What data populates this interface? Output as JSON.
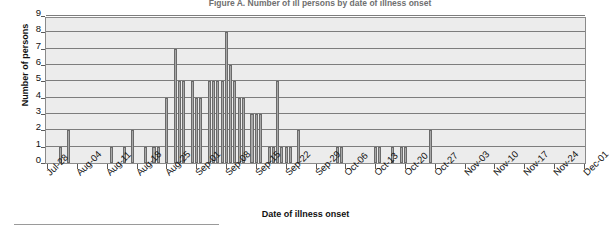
{
  "chart_data": {
    "type": "bar",
    "title": "Figure A. Number of ill persons by date of illness onset",
    "xlabel": "Date of illness onset",
    "ylabel": "Number of persons",
    "ylim": [
      0,
      9
    ],
    "ytick_labels": [
      "0",
      "1",
      "2",
      "3",
      "4",
      "5",
      "6",
      "7",
      "8",
      "9"
    ],
    "grid": true,
    "legend": "none",
    "xtick_labels": [
      "Jul-28",
      "Aug-04",
      "Aug-11",
      "Aug-18",
      "Aug-25",
      "Sep-01",
      "Sep-08",
      "Sep-15",
      "Sep-22",
      "Sep-29",
      "Oct-06",
      "Oct-13",
      "Oct-20",
      "Oct-27",
      "Nov-03",
      "Nov-10",
      "Nov-17",
      "Nov-24",
      "Dec-01"
    ],
    "xtick_interval_days": 7,
    "x_start": "Jul-28",
    "x_end": "Dec-01",
    "bar_color": "#a8a8a8",
    "bar_edge_color": "#6a6a6a",
    "plot_background": "#ececec",
    "categories": [
      "Jul-28",
      "Jul-29",
      "Jul-30",
      "Jul-31",
      "Aug-01",
      "Aug-02",
      "Aug-03",
      "Aug-04",
      "Aug-05",
      "Aug-06",
      "Aug-07",
      "Aug-08",
      "Aug-09",
      "Aug-10",
      "Aug-11",
      "Aug-12",
      "Aug-13",
      "Aug-14",
      "Aug-15",
      "Aug-16",
      "Aug-17",
      "Aug-18",
      "Aug-19",
      "Aug-20",
      "Aug-21",
      "Aug-22",
      "Aug-23",
      "Aug-24",
      "Aug-25",
      "Aug-26",
      "Aug-27",
      "Aug-28",
      "Aug-29",
      "Aug-30",
      "Aug-31",
      "Sep-01",
      "Sep-02",
      "Sep-03",
      "Sep-04",
      "Sep-05",
      "Sep-06",
      "Sep-07",
      "Sep-08",
      "Sep-09",
      "Sep-10",
      "Sep-11",
      "Sep-12",
      "Sep-13",
      "Sep-14",
      "Sep-15",
      "Sep-16",
      "Sep-17",
      "Sep-18",
      "Sep-19",
      "Sep-20",
      "Sep-21",
      "Sep-22",
      "Sep-23",
      "Sep-24",
      "Sep-25",
      "Sep-26",
      "Sep-27",
      "Sep-28",
      "Sep-29",
      "Sep-30",
      "Oct-01",
      "Oct-02",
      "Oct-03",
      "Oct-04",
      "Oct-05",
      "Oct-06",
      "Oct-07",
      "Oct-08",
      "Oct-09",
      "Oct-10",
      "Oct-11",
      "Oct-12",
      "Oct-13",
      "Oct-14",
      "Oct-15",
      "Oct-16",
      "Oct-17",
      "Oct-18",
      "Oct-19",
      "Oct-20",
      "Oct-21",
      "Oct-22",
      "Oct-23",
      "Oct-24",
      "Oct-25",
      "Oct-26",
      "Oct-27",
      "Oct-28",
      "Oct-29",
      "Oct-30",
      "Oct-31",
      "Nov-01",
      "Nov-02",
      "Nov-03",
      "Nov-04",
      "Nov-05",
      "Nov-06",
      "Nov-07",
      "Nov-08",
      "Nov-09",
      "Nov-10",
      "Nov-11",
      "Nov-12",
      "Nov-13",
      "Nov-14",
      "Nov-15",
      "Nov-16",
      "Nov-17",
      "Nov-18",
      "Nov-19",
      "Nov-20",
      "Nov-21",
      "Nov-22",
      "Nov-23",
      "Nov-24",
      "Nov-25",
      "Nov-26",
      "Nov-27",
      "Nov-28",
      "Nov-29",
      "Nov-30",
      "Dec-01"
    ],
    "values": [
      0,
      0,
      0,
      1,
      0,
      2,
      0,
      0,
      0,
      0,
      0,
      0,
      0,
      0,
      0,
      1,
      0,
      0,
      1,
      0,
      2,
      0,
      0,
      1,
      0,
      1,
      1,
      0,
      4,
      0,
      7,
      5,
      5,
      0,
      5,
      4,
      4,
      0,
      5,
      5,
      5,
      5,
      8,
      6,
      5,
      4,
      4,
      0,
      3,
      3,
      3,
      0,
      1,
      1,
      5,
      1,
      1,
      1,
      0,
      2,
      0,
      0,
      0,
      0,
      0,
      0,
      0,
      0,
      1,
      1,
      0,
      0,
      0,
      0,
      0,
      0,
      0,
      1,
      1,
      0,
      0,
      1,
      0,
      1,
      1,
      0,
      0,
      0,
      0,
      0,
      2,
      0,
      0,
      0,
      0,
      0,
      0,
      0,
      0,
      0,
      0,
      0,
      0,
      0,
      0,
      0,
      0,
      0,
      0,
      0,
      0,
      0,
      0,
      0,
      0,
      0,
      0,
      0,
      0,
      0,
      0,
      0,
      0,
      0,
      0,
      0,
      0
    ]
  }
}
